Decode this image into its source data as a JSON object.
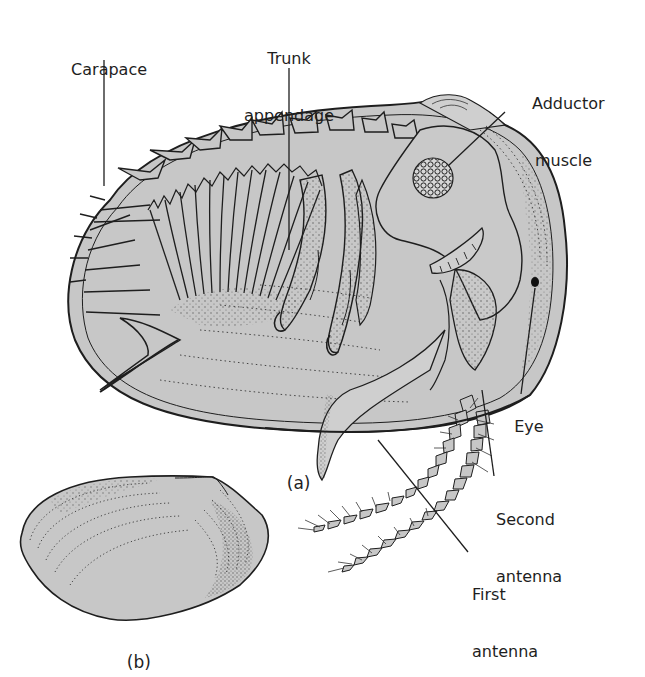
{
  "figure": {
    "colors": {
      "background": "#ffffff",
      "shell_fill": "#c7c7c7",
      "shell_fill_light": "#cfcfcf",
      "ink": "#1e1e1e",
      "stipple": "#555555"
    },
    "panel_a": {
      "label": "(a)",
      "description": "Ostracod in lateral view with one carapace valve removed"
    },
    "panel_b": {
      "label": "(b)",
      "description": "Isolated carapace valve, external view"
    },
    "annotations": [
      {
        "id": "carapace",
        "line1": "Carapace",
        "line2": ""
      },
      {
        "id": "trunk-appendage",
        "line1": "Trunk",
        "line2": "appendage"
      },
      {
        "id": "adductor-muscle",
        "line1": "Adductor",
        "line2": "muscle"
      },
      {
        "id": "eye",
        "line1": "Eye",
        "line2": ""
      },
      {
        "id": "second-antenna",
        "line1": "Second",
        "line2": "antenna"
      },
      {
        "id": "first-antenna",
        "line1": "First",
        "line2": "antenna"
      }
    ]
  }
}
